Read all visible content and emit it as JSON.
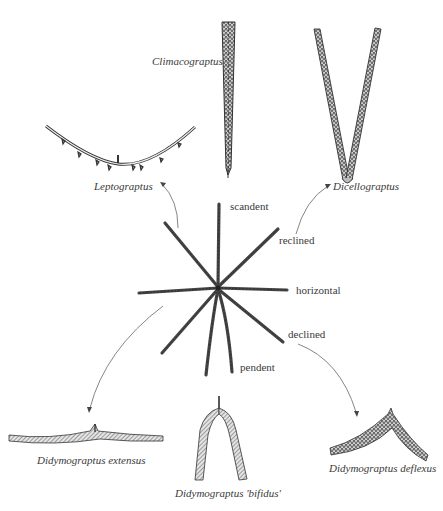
{
  "diagram": {
    "type": "evolutionary-morphology-diagram",
    "center": {
      "name": "graptolite stipe orientations",
      "orientation_labels": [
        {
          "id": "scandent",
          "text": "scandent"
        },
        {
          "id": "reclined",
          "text": "reclined"
        },
        {
          "id": "horizontal",
          "text": "horizontal"
        },
        {
          "id": "declined",
          "text": "declined"
        },
        {
          "id": "pendent",
          "text": "pendent"
        }
      ]
    },
    "taxa": [
      {
        "id": "climacograptus",
        "name": "Climacograptus",
        "orientation": "scandent"
      },
      {
        "id": "dicellograptus",
        "name": "Dicellograptus",
        "orientation": "reclined"
      },
      {
        "id": "leptograptus",
        "name": "Leptograptus",
        "orientation": "reclined"
      },
      {
        "id": "didymograptus-extensus",
        "name": "Didymograptus extensus",
        "orientation": "horizontal"
      },
      {
        "id": "didymograptus-bifidus",
        "name": "Didymograptus 'bifidus'",
        "orientation": "pendent"
      },
      {
        "id": "didymograptus-deflexus",
        "name": "Didymograptus deflexus",
        "orientation": "declined"
      }
    ],
    "arrows": [
      {
        "from": "center",
        "to": "leptograptus"
      },
      {
        "from": "center",
        "to": "dicellograptus"
      },
      {
        "from": "center",
        "to": "didymograptus-extensus"
      },
      {
        "from": "center",
        "to": "didymograptus-deflexus"
      }
    ],
    "colors": {
      "background": "#ffffff",
      "ink": "#333333",
      "label": "#3a3a3a",
      "arrow": "#777777"
    }
  }
}
